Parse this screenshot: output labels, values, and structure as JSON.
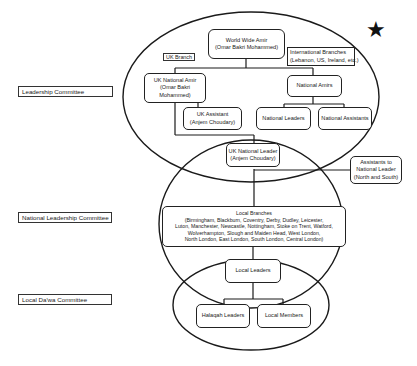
{
  "committees": {
    "leadership": "Leadership Committee",
    "national_leadership": "National Leadership Committee",
    "local_dawa": "Local Da'wa Committee"
  },
  "tags": {
    "uk_branch": "UK Branch"
  },
  "nodes": {
    "world_wide_amir": {
      "title": "World Wide Amir",
      "name": "(Omar Bakri Mohammed)"
    },
    "international_branches": {
      "title": "International Branches",
      "detail": "(Lebanon, US, Ireland, etc.)"
    },
    "uk_national_amir": {
      "line1": "UK National Amir",
      "line2": "(Omar Bakri",
      "line3": "Mohammed)"
    },
    "national_amirs": {
      "title": "National Amirs"
    },
    "uk_assistant": {
      "title": "UK Assistant",
      "name": "(Anjem Choudary)"
    },
    "national_leaders": {
      "title": "National Leaders"
    },
    "national_assistants": {
      "title": "National Assistants"
    },
    "uk_national_leader": {
      "title": "UK National Leader",
      "name": "(Anjem Choudary)"
    },
    "assistants_to_national_leader": {
      "line1": "Assistants to",
      "line2": "National Leader",
      "line3": "(North and South)"
    },
    "local_branches": {
      "title": "Local Branches",
      "lines": [
        "(Birmingham, Blackburn, Coventry, Derby, Dudley, Leicester,",
        "Luton, Manchester, Newcastle, Nottingham, Stoke on Trent, Watford,",
        "Wolverhampton, Slough and Maiden Head, West London,",
        "North London, East London, South London, Central London)"
      ]
    },
    "local_leaders": {
      "title": "Local Leaders"
    },
    "halaqah_leaders": {
      "title": "Halaqah Leaders"
    },
    "local_members": {
      "title": "Local Members"
    }
  },
  "decorations": {
    "star": "★"
  },
  "colors": {
    "ink": "#1a1a1a",
    "background": "#ffffff"
  }
}
